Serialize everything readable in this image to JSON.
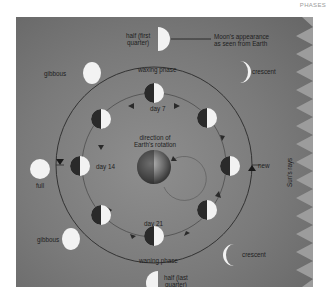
{
  "header": {
    "page_label": "PHASES"
  },
  "legend": {
    "label": "Moon's appearance as seen from Earth",
    "line1": "Moon's appearance",
    "line2": "as seen from Earth"
  },
  "labels": {
    "waxing_phase": "waxing phase",
    "waning_phase": "waning phase",
    "earth_rotation_line1": "direction of",
    "earth_rotation_line2": "Earth's rotation",
    "sun_rays": "Sun's rays"
  },
  "orbit_days": [
    {
      "id": "day7",
      "label": "day 7"
    },
    {
      "id": "day14",
      "label": "day 14"
    },
    {
      "id": "day21",
      "label": "day 21"
    }
  ],
  "phases": [
    {
      "id": "first-quarter",
      "line1": "half (first",
      "line2": "quarter)"
    },
    {
      "id": "waxing-crescent",
      "line1": "crescent"
    },
    {
      "id": "new",
      "line1": "new"
    },
    {
      "id": "waning-crescent",
      "line1": "crescent"
    },
    {
      "id": "last-quarter",
      "line1": "half (last",
      "line2": "quarter)"
    },
    {
      "id": "waning-gibbous",
      "line1": "gibbous"
    },
    {
      "id": "full",
      "line1": "full"
    },
    {
      "id": "waxing-gibbous",
      "line1": "gibbous"
    }
  ],
  "colors": {
    "panel_bg": "#7a7a7a",
    "moon_light": "#f2f2f2",
    "moon_dark": "#2a2a2a",
    "orbit_line": "#2a2a2a",
    "sun_tooth": "#9a9a9a"
  }
}
